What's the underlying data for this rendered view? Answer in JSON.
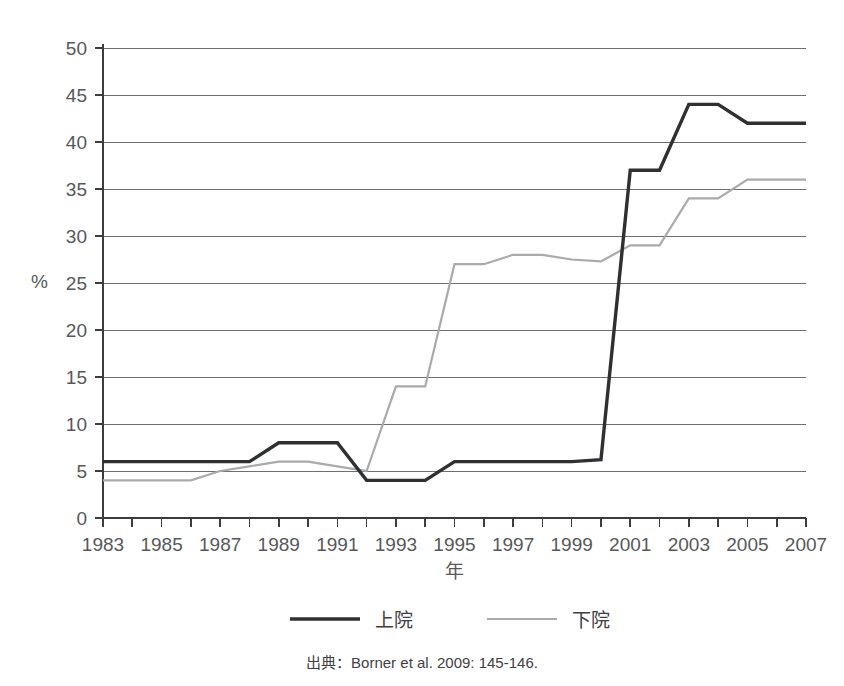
{
  "caption": {
    "source_text": "出典：Borner et al. 2009: 145-146."
  },
  "legend": {
    "position": "bottom",
    "entries": [
      {
        "label": "上院",
        "color": "#2f3032",
        "style": "thick-solid"
      },
      {
        "label": "下院",
        "color": "#a9aaac",
        "style": "thin-solid"
      }
    ]
  },
  "axis": {
    "y_unit_label": "%",
    "x_title": "年",
    "y_ticks": [
      "0",
      "5",
      "10",
      "15",
      "20",
      "25",
      "30",
      "35",
      "40",
      "45",
      "50"
    ],
    "x_ticks_labeled": [
      "1983",
      "1985",
      "1987",
      "1989",
      "1991",
      "1993",
      "1995",
      "1997",
      "1999",
      "2001",
      "2003",
      "2005",
      "2007"
    ]
  },
  "chart_data": {
    "type": "line",
    "title": "",
    "xlabel": "年",
    "ylabel": "%",
    "xlim": [
      1983,
      2007
    ],
    "ylim": [
      0,
      50
    ],
    "ytick_step": 5,
    "xtick_step": 1,
    "xtick_label_step": 2,
    "grid": true,
    "legend_position": "bottom",
    "x": [
      1983,
      1984,
      1985,
      1986,
      1987,
      1988,
      1989,
      1990,
      1991,
      1992,
      1993,
      1994,
      1995,
      1996,
      1997,
      1998,
      1999,
      2000,
      2001,
      2002,
      2003,
      2004,
      2005,
      2006,
      2007
    ],
    "series": [
      {
        "name": "上院",
        "color": "#2f3032",
        "values": [
          6,
          6,
          6,
          6,
          6,
          6,
          8,
          8,
          8,
          4,
          4,
          4,
          6,
          6,
          6,
          6,
          6,
          6.2,
          37,
          37,
          44,
          44,
          42,
          42,
          42
        ]
      },
      {
        "name": "下院",
        "color": "#a9aaac",
        "values": [
          4,
          4,
          4,
          4,
          5,
          5.5,
          6,
          6,
          5.5,
          5,
          14,
          14,
          27,
          27,
          28,
          28,
          27.5,
          27.3,
          29,
          29,
          34,
          34,
          36,
          36,
          36
        ]
      }
    ]
  }
}
